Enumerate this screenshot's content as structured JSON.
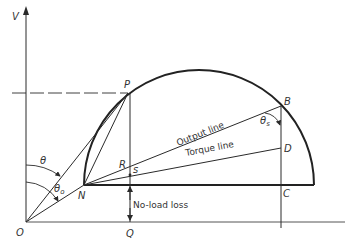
{
  "diagram": {
    "axis_label": "V",
    "points": {
      "O": "O",
      "P": "P",
      "N": "N",
      "B": "B",
      "C": "C",
      "D": "D",
      "R": "R",
      "S": "s",
      "Q": "Q"
    },
    "angles": {
      "theta": "θ",
      "theta0": "θ",
      "theta0_sub": "o",
      "thetas": "θ",
      "thetas_sub": "s"
    },
    "lines": {
      "output": "Output line",
      "torque": "Torque line",
      "noload": "No-load loss"
    },
    "colors": {
      "stroke": "#2a2a2a",
      "text": "#333333"
    }
  }
}
